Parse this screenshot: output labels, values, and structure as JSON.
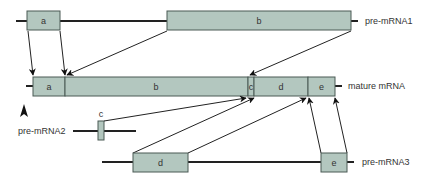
{
  "figure": {
    "colors": {
      "exon_fill": "#b3c7bf",
      "exon_stroke": "#4a5a55",
      "line": "#222222"
    },
    "transcripts": {
      "pre_mRNA1": {
        "label": "pre-mRNA1",
        "exons": [
          "a",
          "b"
        ]
      },
      "mature_mRNA": {
        "label": "mature mRNA",
        "exons": [
          "a",
          "b",
          "c",
          "d",
          "e"
        ]
      },
      "pre_mRNA2": {
        "label": "pre-mRNA2",
        "exons": [
          "c"
        ]
      },
      "pre_mRNA3": {
        "label": "pre-mRNA3",
        "exons": [
          "d",
          "e"
        ]
      }
    }
  }
}
